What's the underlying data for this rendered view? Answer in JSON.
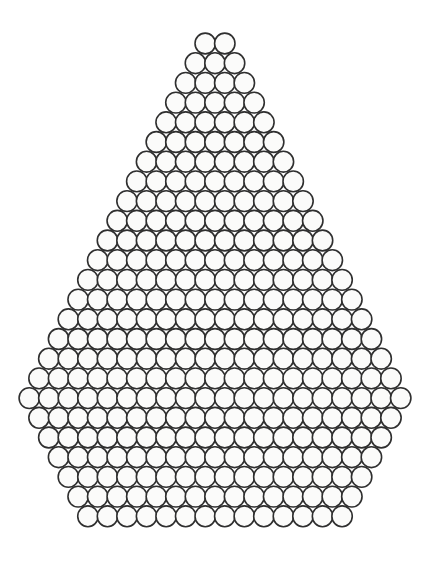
{
  "figure": {
    "shape_name": "rhombus",
    "background_color": "#ffffff",
    "stroke_color": "#2f2f2f",
    "fill_color": "#fbfbfa",
    "stroke_width": 1.6,
    "canvas": {
      "width": 429,
      "height": 567
    }
  },
  "chart_data": {
    "type": "scatter",
    "subtitle": "",
    "xlabel": "",
    "ylabel": "",
    "grid": false,
    "legend_position": "none",
    "xlim": [
      0,
      429
    ],
    "ylim": [
      0,
      567
    ],
    "marker": {
      "shape": "ellipse",
      "radius_x": 10.2,
      "radius_y": 10.4,
      "fill": "#fbfbfa",
      "stroke": "#2f2f2f",
      "stroke_width": 1.6
    },
    "lattice": {
      "x_pitch": 19.55,
      "y_pitch": 19.7,
      "row_offset_mode": "alternating-half-pitch",
      "center_x": 215.0,
      "top_row_center_y": 43.5,
      "rows_total": 25,
      "min_row_count": 2,
      "max_row_count": 20,
      "total_ellipses": 528
    },
    "categories": [
      "row 1",
      "row 2",
      "row 3",
      "row 4",
      "row 5",
      "row 6",
      "row 7",
      "row 8",
      "row 9",
      "row 10",
      "row 11",
      "row 12",
      "row 13",
      "row 14",
      "row 15",
      "row 16",
      "row 17",
      "row 18",
      "row 19",
      "row 20",
      "row 21",
      "row 22",
      "row 23",
      "row 24",
      "row 25"
    ],
    "values": [
      2,
      3,
      4,
      5,
      6,
      7,
      8,
      9,
      10,
      11,
      12,
      13,
      14,
      15,
      16,
      17,
      18,
      19,
      20,
      19,
      18,
      17,
      16,
      15,
      14
    ],
    "series": [
      {
        "name": "ellipses per row",
        "values": [
          2,
          3,
          4,
          5,
          6,
          7,
          8,
          9,
          10,
          11,
          12,
          13,
          14,
          15,
          16,
          17,
          18,
          19,
          20,
          19,
          18,
          17,
          16,
          15,
          14
        ]
      }
    ],
    "rows": [
      {
        "index": 1,
        "count": 2,
        "center_y": 43.5
      },
      {
        "index": 2,
        "count": 3,
        "center_y": 63.2
      },
      {
        "index": 3,
        "count": 4,
        "center_y": 82.9
      },
      {
        "index": 4,
        "count": 5,
        "center_y": 102.6
      },
      {
        "index": 5,
        "count": 6,
        "center_y": 122.3
      },
      {
        "index": 6,
        "count": 7,
        "center_y": 142.0
      },
      {
        "index": 7,
        "count": 8,
        "center_y": 161.7
      },
      {
        "index": 8,
        "count": 9,
        "center_y": 181.4
      },
      {
        "index": 9,
        "count": 10,
        "center_y": 201.1
      },
      {
        "index": 10,
        "count": 11,
        "center_y": 220.8
      },
      {
        "index": 11,
        "count": 12,
        "center_y": 240.5
      },
      {
        "index": 12,
        "count": 13,
        "center_y": 260.2
      },
      {
        "index": 13,
        "count": 14,
        "center_y": 279.9
      },
      {
        "index": 14,
        "count": 15,
        "center_y": 299.6
      },
      {
        "index": 15,
        "count": 16,
        "center_y": 319.3
      },
      {
        "index": 16,
        "count": 17,
        "center_y": 339.0
      },
      {
        "index": 17,
        "count": 18,
        "center_y": 358.7
      },
      {
        "index": 18,
        "count": 19,
        "center_y": 378.4
      },
      {
        "index": 19,
        "count": 20,
        "center_y": 398.1
      },
      {
        "index": 20,
        "count": 19,
        "center_y": 417.8
      },
      {
        "index": 21,
        "count": 18,
        "center_y": 437.5
      },
      {
        "index": 22,
        "count": 17,
        "center_y": 457.2
      },
      {
        "index": 23,
        "count": 16,
        "center_y": 476.9
      },
      {
        "index": 24,
        "count": 15,
        "center_y": 496.6
      },
      {
        "index": 25,
        "count": 14,
        "center_y": 516.3
      }
    ],
    "annotations": []
  }
}
